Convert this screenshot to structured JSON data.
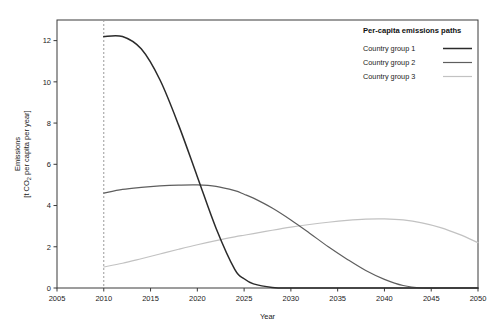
{
  "chart_data": {
    "type": "line",
    "title": "",
    "xlabel": "Year",
    "ylabel": "Emissions\n[t CO2 per capita per year]",
    "ylabel_line1": "Emissions",
    "ylabel_line2": "[t CO₂ per capita per year]",
    "xlim": [
      2005,
      2050
    ],
    "ylim": [
      0,
      13
    ],
    "xticks": [
      2005,
      2010,
      2015,
      2020,
      2025,
      2030,
      2035,
      2040,
      2045,
      2050
    ],
    "yticks": [
      0,
      2,
      4,
      6,
      8,
      10,
      12
    ],
    "grid": false,
    "legend_position": "top-right",
    "legend_title": "Per-capita emissions paths",
    "annotations": [
      {
        "name": "start-year-marker",
        "type": "vline",
        "x": 2010,
        "style": "dashed",
        "color": "#9a9a9a"
      }
    ],
    "x": [
      2010,
      2012,
      2014,
      2016,
      2018,
      2020,
      2022,
      2024,
      2025,
      2026,
      2028,
      2030,
      2032,
      2034,
      2036,
      2038,
      2040,
      2042,
      2044,
      2046,
      2048,
      2050
    ],
    "series": [
      {
        "name": "Country group 1",
        "color": "#2b2b2b",
        "width": 1.5,
        "values": [
          12.2,
          12.2,
          11.6,
          10.1,
          7.9,
          5.4,
          2.9,
          0.9,
          0.45,
          0.2,
          0.03,
          0.0,
          0.0,
          0.0,
          0.0,
          0.0,
          0.0,
          0.0,
          0.0,
          0.0,
          0.0,
          0.0
        ]
      },
      {
        "name": "Country group 2",
        "color": "#5e5e5e",
        "width": 1.2,
        "values": [
          4.6,
          4.78,
          4.88,
          4.95,
          4.99,
          5.0,
          4.93,
          4.72,
          4.55,
          4.36,
          3.88,
          3.3,
          2.66,
          2.0,
          1.4,
          0.85,
          0.42,
          0.12,
          0.0,
          0.0,
          0.0,
          0.0
        ]
      },
      {
        "name": "Country group 3",
        "color": "#c2c2c2",
        "width": 1.2,
        "values": [
          1.02,
          1.2,
          1.42,
          1.65,
          1.88,
          2.1,
          2.3,
          2.48,
          2.56,
          2.64,
          2.8,
          2.95,
          3.08,
          3.19,
          3.28,
          3.34,
          3.35,
          3.3,
          3.16,
          2.93,
          2.6,
          2.2
        ]
      }
    ]
  },
  "legend": {
    "title": "Per-capita emissions paths",
    "entries": [
      {
        "label": "Country group 1",
        "color": "#2b2b2b"
      },
      {
        "label": "Country group 2",
        "color": "#5e5e5e"
      },
      {
        "label": "Country group 3",
        "color": "#c2c2c2"
      }
    ]
  },
  "axes": {
    "x_title": "Year",
    "y_title_line1": "Emissions",
    "y_title_line2": "[t CO₂ per capita per year]",
    "x_tick_labels": [
      "2005",
      "2010",
      "2015",
      "2020",
      "2025",
      "2030",
      "2035",
      "2040",
      "2045",
      "2050"
    ],
    "y_tick_labels": [
      "0",
      "2",
      "4",
      "6",
      "8",
      "10",
      "12"
    ]
  },
  "caption": {
    "text": ""
  }
}
